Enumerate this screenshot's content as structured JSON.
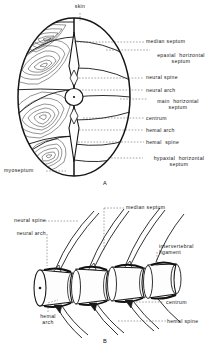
{
  "figure": {
    "title_a": "A",
    "title_b": "B",
    "panel_a": {
      "description": "Transverse section through fish trunk showing myomere and septum arrangement",
      "labels_top": [
        {
          "text": "skin",
          "x": 76,
          "y": 8
        }
      ],
      "labels_right": [
        {
          "text": "median septum",
          "x": 146,
          "y": 40
        },
        {
          "text": "epaxial  horizontal\nseptum",
          "x": 152,
          "y": 56
        },
        {
          "text": "neural spine",
          "x": 146,
          "y": 76
        },
        {
          "text": "neural arch",
          "x": 146,
          "y": 92
        },
        {
          "text": "main  horizontal\nseptum",
          "x": 150,
          "y": 102
        },
        {
          "text": "centrum",
          "x": 146,
          "y": 118
        },
        {
          "text": "hemal arch",
          "x": 146,
          "y": 131
        },
        {
          "text": "hemal  spine",
          "x": 146,
          "y": 143
        },
        {
          "text": "hypaxial  horizontal\nseptum",
          "x": 145,
          "y": 160
        }
      ],
      "labels_left": [
        {
          "text": "myoseptum",
          "x": 12,
          "y": 170
        }
      ]
    },
    "panel_b": {
      "description": "Lateral view of several articulated vertebrae with spines and ligaments",
      "labels_left": [
        {
          "text": "neural spine",
          "x": 12,
          "y": 220
        },
        {
          "text": "neural arch",
          "x": 16,
          "y": 233
        },
        {
          "text": "hemal\narch",
          "x": 36,
          "y": 315
        }
      ],
      "labels_right": [
        {
          "text": "median septum",
          "x": 126,
          "y": 204
        },
        {
          "text": "intervertebral\nligament",
          "x": 159,
          "y": 245
        },
        {
          "text": "centrum",
          "x": 166,
          "y": 305
        },
        {
          "text": "hemal spine",
          "x": 168,
          "y": 320
        }
      ]
    }
  },
  "colors": {
    "ink": "#1a1a1a",
    "leader": "#555555",
    "paper": "#ffffff",
    "muscle_line": "#3b3b3b"
  }
}
